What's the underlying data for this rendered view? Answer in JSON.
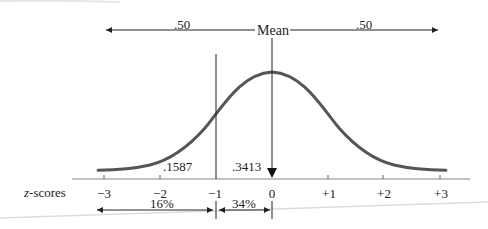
{
  "diagram": {
    "top_arrow": {
      "left_label": ".50",
      "center_label": "Mean",
      "right_label": ".50"
    },
    "area_labels": {
      "tail_below_minus1": ".1587",
      "between_minus1_and_mean": ".3413"
    },
    "axis": {
      "label_prefix": "z",
      "label_suffix": "-scores",
      "ticks": [
        "−3",
        "−2",
        "−1",
        "0",
        "+1",
        "+2",
        "+3"
      ]
    },
    "bottom_spans": {
      "left_percent": "16%",
      "right_percent": "34%"
    },
    "colors": {
      "curve": "#555555",
      "lines": "#222222",
      "axis": "#888888"
    }
  }
}
